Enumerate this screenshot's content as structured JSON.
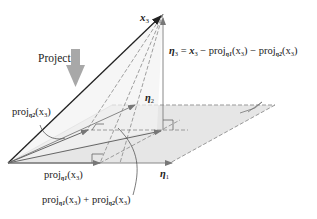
{
  "diagram": {
    "labels": {
      "project": "Project",
      "x3": "x",
      "x3_sub": "3",
      "eta3_eq_lhs": "η",
      "eta3_eq_lhs_sub": "3",
      "eta3_eq_rhs_1": " = ",
      "eta3_eq_x": "x",
      "eta3_eq_x_sub": "3",
      "eta3_eq_minus1": " − proj",
      "eta3_eq_proj1_sub": "η1",
      "eta3_eq_arg1": "(x",
      "eta3_eq_arg1_sub": "3",
      "eta3_eq_close1": ")",
      "eta3_eq_minus2": " − proj",
      "eta3_eq_proj2_sub": "η2",
      "eta3_eq_arg2": "(x",
      "eta3_eq_arg2_sub": "3",
      "eta3_eq_close2": ")",
      "eta2": "η",
      "eta2_sub": "2",
      "eta1": "η",
      "eta1_sub": "1",
      "proj_eta2": "proj",
      "proj_eta2_sub": "η2",
      "proj_eta2_arg": "(x",
      "proj_eta2_arg_sub": "3",
      "proj_eta2_close": ")",
      "proj_eta1": "proj",
      "proj_eta1_sub": "η1",
      "proj_eta1_arg": "(x",
      "proj_eta1_arg_sub": "3",
      "proj_eta1_close": ")",
      "sum_proj_a": "proj",
      "sum_proj_a_sub": "η1",
      "sum_proj_a_arg": "(x",
      "sum_proj_a_arg_sub": "3",
      "sum_proj_a_close": ") + proj",
      "sum_proj_b_sub": "η2",
      "sum_proj_b_arg": "(x",
      "sum_proj_b_arg_sub": "3",
      "sum_proj_b_close": ")"
    },
    "colors": {
      "plane_fill": "#e6e6e6",
      "plane_edge": "#999999",
      "vector": "#222222",
      "gray_vector": "#8a8a8a",
      "project_arrow": "#a8a8a8"
    }
  }
}
